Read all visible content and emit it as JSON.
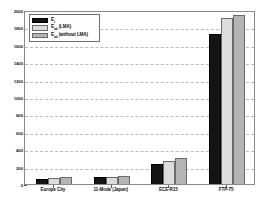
{
  "chart_data": {
    "type": "bar",
    "title": "",
    "xlabel": "",
    "ylabel": "",
    "ylim": [
      0,
      2000
    ],
    "ytick_step": 200,
    "grid": true,
    "legend_position": "upper-left",
    "categories": [
      "Europe City",
      "11-Mode (Japan)",
      "ECE-R15",
      "FTP-75"
    ],
    "yticks": [
      "0",
      "200",
      "400",
      "600",
      "800",
      "1000",
      "1200",
      "1400",
      "1600",
      "1800",
      "2000"
    ],
    "series": [
      {
        "name": "E_t",
        "label_main": "E",
        "label_sub": "t",
        "label_suffix": "",
        "color": "#141414",
        "values": [
          60,
          75,
          225,
          1730
        ]
      },
      {
        "name": "E_ab (LMA)",
        "label_main": "E",
        "label_sub": "ab",
        "label_suffix": " (LMA)",
        "color": "#dcdcdc",
        "values": [
          70,
          85,
          265,
          1905
        ]
      },
      {
        "name": "E_ab (without LMA)",
        "label_main": "E",
        "label_sub": "ab",
        "label_suffix": " (without LMA)",
        "color": "#b4b4b4",
        "values": [
          75,
          88,
          300,
          1940
        ]
      }
    ]
  },
  "figure": {
    "axis_color": "#8a8a8a",
    "grid_color": "#9fb4c4",
    "background": "#ffffff"
  }
}
